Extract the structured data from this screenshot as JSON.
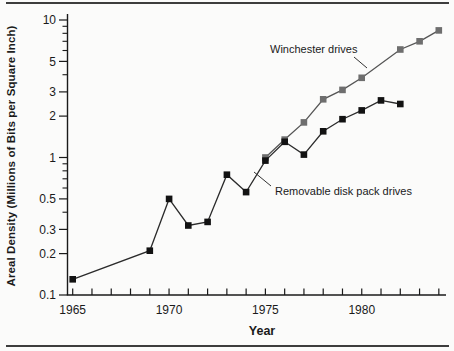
{
  "colors": {
    "background": "#fbfbfa",
    "rule": "#3d3d3d",
    "axis": "#1a1a1a",
    "text": "#1a1a1a",
    "winchester_marker": "#6e6e6e",
    "winchester_line": "#555555",
    "removable_marker": "#121212",
    "removable_line": "#2b2b2b"
  },
  "chart_data": {
    "type": "line",
    "title": "",
    "x_axis": {
      "label": "Year",
      "tick_start_year": 1965,
      "tick_end_year": 1984,
      "labeled_ticks": [
        1965,
        1970,
        1975,
        1980
      ]
    },
    "y_axis": {
      "label": "Areal Density (Millions of Bits per Square Inch)",
      "scale": "log",
      "range": [
        0.1,
        10
      ],
      "labeled_ticks": [
        10,
        5,
        3,
        2,
        1,
        0.5,
        0.3,
        0.2,
        0.1
      ],
      "minor_ticks": [
        9,
        8,
        7,
        6,
        4,
        0.9,
        0.8,
        0.7,
        0.6,
        0.4
      ]
    },
    "series": [
      {
        "name": "Winchester drives",
        "marker": "square",
        "marker_color": "#6e6e6e",
        "line_color": "#555555",
        "x": [
          1975,
          1976,
          1977,
          1978,
          1979,
          1980,
          1982,
          1983,
          1984
        ],
        "y": [
          1.0,
          1.35,
          1.8,
          2.65,
          3.1,
          3.8,
          6.1,
          7.0,
          8.4
        ]
      },
      {
        "name": "Removable disk pack drives",
        "marker": "square",
        "marker_color": "#121212",
        "line_color": "#2b2b2b",
        "x": [
          1965,
          1969,
          1970,
          1971,
          1972,
          1973,
          1974,
          1975,
          1976,
          1977,
          1978,
          1979,
          1980,
          1981,
          1982
        ],
        "y": [
          0.13,
          0.21,
          0.5,
          0.32,
          0.34,
          0.75,
          0.56,
          0.95,
          1.3,
          1.05,
          1.55,
          1.9,
          2.2,
          2.6,
          2.45
        ]
      }
    ],
    "annotations": [
      {
        "text": "Winchester drives",
        "text_x": 270,
        "text_y": 53,
        "line_from": [
          354,
          57
        ],
        "line_to": [
          367,
          68
        ]
      },
      {
        "text": "Removable disk pack drives",
        "text_x": 275,
        "text_y": 195,
        "line_from": [
          271,
          186
        ],
        "line_to": [
          254,
          172
        ]
      }
    ],
    "layout_hints": {
      "grid": false,
      "legend": "inline-annotations",
      "plot_left_px": 67.5,
      "plot_bottom_px": 295,
      "plot_top_px": 20,
      "x_year_origin_px": 72.7,
      "x_px_per_year": 19.27,
      "y_px_per_decade": 137.5
    }
  }
}
